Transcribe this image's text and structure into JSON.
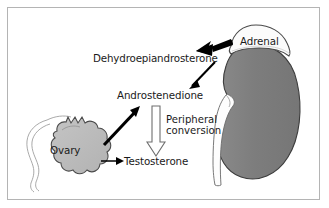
{
  "figure": {
    "background_color": "#ffffff",
    "border_color": "#b4b4b4"
  },
  "labels": {
    "dehydroepiandrosterone": "Dehydroepiandrosterone",
    "androstenedione": "Androstenedione",
    "testosterone": "Testosterone",
    "peripheral_conversion_line1": "Peripheral",
    "peripheral_conversion_line2": "conversion",
    "adrenal": "Adrenal",
    "ovary": "Ovary"
  },
  "organs": [
    {
      "name": "adrenal-gland",
      "label": "Adrenal",
      "fill_color": "#fbfbfb",
      "stroke_color": "#4a4a4a"
    },
    {
      "name": "kidney",
      "label": "",
      "fill_color": "#7e7e7e",
      "stroke_color": "#3c3c3c"
    },
    {
      "name": "ureter",
      "label": "",
      "fill_color": "#fdfdfd",
      "stroke_color": "#6a6a6a"
    },
    {
      "name": "ovary",
      "label": "Ovary",
      "fill_color": "#bcbcbc",
      "stroke_color": "#4a4a4a"
    },
    {
      "name": "fallopian-tube",
      "label": "",
      "fill_color": "none",
      "stroke_color": "#9a9a9a"
    }
  ],
  "arrows": [
    {
      "name": "arrow-adrenal-to-dhea",
      "style": "thick-solid-black",
      "from": "Adrenal",
      "to": "Dehydroepiandrosterone",
      "color": "#000000"
    },
    {
      "name": "arrow-dhea-to-androstenedione",
      "style": "thin-solid-black",
      "from": "Dehydroepiandrosterone",
      "to": "Androstenedione",
      "color": "#000000"
    },
    {
      "name": "arrow-ovary-to-androstenedione",
      "style": "thick-solid-black",
      "from": "Ovary",
      "to": "Androstenedione",
      "color": "#000000"
    },
    {
      "name": "arrow-ovary-to-testosterone",
      "style": "thin-solid-black",
      "from": "Ovary",
      "to": "Testosterone",
      "color": "#000000"
    },
    {
      "name": "arrow-peripheral-conversion",
      "style": "hollow-outline",
      "from": "Androstenedione",
      "to": "Testosterone",
      "color": "#6e6e6e"
    }
  ]
}
